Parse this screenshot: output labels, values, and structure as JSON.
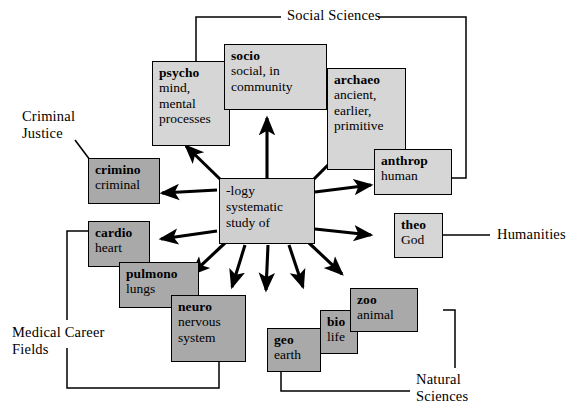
{
  "diagram": {
    "center": {
      "root": "-logy",
      "gloss": "systematic\nstudy of"
    },
    "colors": {
      "dark_fill": "#a9a9a9",
      "light_fill": "#d6d6d6",
      "center_fill": "#cfcfcf",
      "stroke": "#000000",
      "background": "#ffffff"
    },
    "nodes": [
      {
        "id": "psycho",
        "root": "psycho",
        "gloss": "mind,\nmental\nprocesses",
        "shade": "light"
      },
      {
        "id": "socio",
        "root": "socio",
        "gloss": "social, in\ncommunity",
        "shade": "light"
      },
      {
        "id": "archaeo",
        "root": "archaeo",
        "gloss": "ancient,\nearlier,\nprimitive",
        "shade": "light"
      },
      {
        "id": "anthrop",
        "root": "anthrop",
        "gloss": "human",
        "shade": "light"
      },
      {
        "id": "crimino",
        "root": "crimino",
        "gloss": "criminal",
        "shade": "dark"
      },
      {
        "id": "theo",
        "root": "theo",
        "gloss": "God",
        "shade": "light"
      },
      {
        "id": "cardio",
        "root": "cardio",
        "gloss": "heart",
        "shade": "dark"
      },
      {
        "id": "pulmono",
        "root": "pulmono",
        "gloss": "lungs",
        "shade": "dark"
      },
      {
        "id": "neuro",
        "root": "neuro",
        "gloss": "nervous\nsystem",
        "shade": "dark"
      },
      {
        "id": "geo",
        "root": "geo",
        "gloss": "earth",
        "shade": "dark"
      },
      {
        "id": "bio",
        "root": "bio",
        "gloss": "life",
        "shade": "dark"
      },
      {
        "id": "zoo",
        "root": "zoo",
        "gloss": "animal",
        "shade": "dark"
      }
    ],
    "brackets": [
      {
        "id": "social-sciences",
        "label": "Social Sciences",
        "members": [
          "socio",
          "psycho",
          "archaeo",
          "anthrop"
        ]
      },
      {
        "id": "criminal-justice",
        "label": "Criminal\nJustice",
        "members": [
          "crimino"
        ]
      },
      {
        "id": "humanities",
        "label": "Humanities",
        "members": [
          "theo"
        ]
      },
      {
        "id": "medical-career-fields",
        "label": "Medical Career\nFields",
        "members": [
          "cardio",
          "neuro"
        ]
      },
      {
        "id": "natural-sciences",
        "label": "Natural\nSciences",
        "members": [
          "geo",
          "zoo"
        ]
      }
    ],
    "arrow_count": 10
  }
}
